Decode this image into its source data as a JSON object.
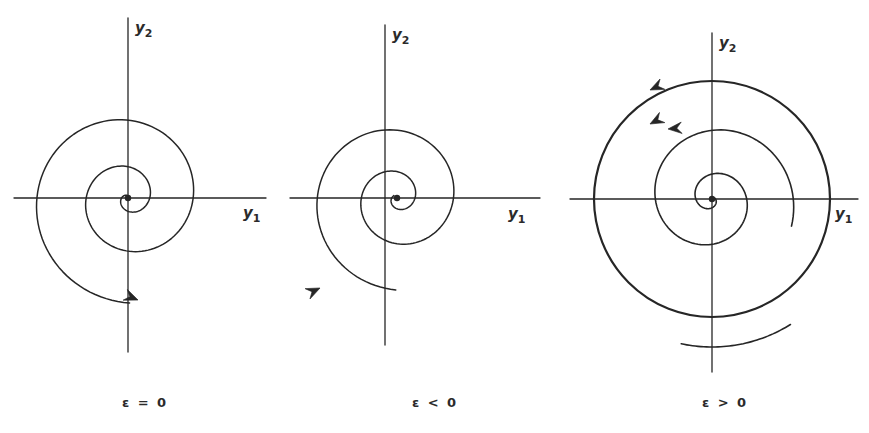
{
  "figure": {
    "title": "",
    "background": "#ffffff",
    "ink": "#262626",
    "width": 869,
    "height": 433
  },
  "panels": [
    {
      "id": "epsilon-zero",
      "caption": "ε = 0",
      "caption_x": 0,
      "caption_y": 395,
      "center": {
        "x": 128,
        "y": 198
      },
      "axes": {
        "x_axis": {
          "x1": 14,
          "y1": 198,
          "x2": 266,
          "y2": 198
        },
        "y_axis": {
          "x1": 128,
          "y1": 18,
          "x2": 128,
          "y2": 352
        },
        "x_label": {
          "text": "y",
          "sub": "1",
          "x": 243,
          "y": 205
        },
        "y_label": {
          "text": "y",
          "sub": "2",
          "x": 135,
          "y": 20
        }
      },
      "trajectory": {
        "type": "spiral",
        "direction": "outward",
        "rotation": "clockwise",
        "r_start": 3,
        "r_end": 105,
        "theta_start": 1.9,
        "theta_turns": 2.45,
        "stroke_width": 1.5
      },
      "arrows": [
        {
          "name": "flow-arrow",
          "x": 138,
          "y": 300,
          "angle": -22
        }
      ],
      "limit_cycle": null
    },
    {
      "id": "epsilon-negative",
      "caption": "ε < 0",
      "caption_x": 290,
      "caption_y": 395,
      "center": {
        "x": 397,
        "y": 198
      },
      "axes": {
        "x_axis": {
          "x1": 290,
          "y1": 198,
          "x2": 540,
          "y2": 198
        },
        "y_axis": {
          "x1": 385,
          "y1": 25,
          "x2": 385,
          "y2": 345
        },
        "x_label": {
          "text": "y",
          "sub": "1",
          "x": 508,
          "y": 206
        },
        "y_label": {
          "text": "y",
          "sub": "2",
          "x": 392,
          "y": 27
        }
      },
      "trajectory": {
        "type": "spiral",
        "direction": "outward",
        "rotation": "clockwise",
        "r_start": 4,
        "r_end": 92,
        "theta_start": 2.5,
        "theta_turns": 2.35,
        "stroke_width": 1.5
      },
      "arrows": [
        {
          "name": "flow-arrow",
          "x": 320,
          "y": 288,
          "angle": 25
        }
      ],
      "limit_cycle": null
    },
    {
      "id": "epsilon-positive",
      "caption": "ε > 0",
      "caption_x": 580,
      "caption_y": 395,
      "center": {
        "x": 712,
        "y": 199
      },
      "axes": {
        "x_axis": {
          "x1": 570,
          "y1": 199,
          "x2": 858,
          "y2": 199
        },
        "y_axis": {
          "x1": 712,
          "y1": 33,
          "x2": 712,
          "y2": 372
        },
        "x_label": {
          "text": "y",
          "sub": "1",
          "x": 835,
          "y": 206
        },
        "y_label": {
          "text": "y",
          "sub": "2",
          "x": 719,
          "y": 35
        }
      },
      "trajectory": {
        "type": "spiral",
        "direction": "outward",
        "rotation": "counterclockwise",
        "r_start": 3,
        "r_end": 84,
        "theta_start": 0.3,
        "theta_turns": 2.1,
        "stroke_width": 1.6
      },
      "arrows": [
        {
          "name": "limit-cycle-arrow",
          "x": 650,
          "y": 124,
          "angle": 208
        },
        {
          "name": "inner-spiral-arrow",
          "x": 668,
          "y": 129,
          "angle": 185
        }
      ],
      "limit_cycle": {
        "name": "limit-cycle",
        "radius": 118,
        "stroke_width": 2.2
      },
      "outer_arc": {
        "name": "incoming-arc",
        "radius": 148,
        "theta_start": 258,
        "theta_end": 302,
        "arrow": {
          "x": 650,
          "y": 90,
          "angle": 205
        }
      }
    }
  ],
  "chart_data": {
    "type": "line",
    "xlabel": "y₁",
    "ylabel": "y₂",
    "series": [
      {
        "name": "ε = 0",
        "description": "Outward spiral trajectory from the origin, clockwise, no limit cycle",
        "equilibrium": [
          0,
          0
        ],
        "turns": 2.45
      },
      {
        "name": "ε < 0",
        "description": "Spiral trajectory winding toward the origin, clockwise, stable focus",
        "equilibrium": [
          0,
          0
        ],
        "turns": 2.35
      },
      {
        "name": "ε > 0",
        "description": "Inner spiral growing outward onto a closed limit cycle, counterclockwise",
        "equilibrium": [
          0,
          0
        ],
        "turns": 2.1,
        "limit_cycle_radius": 118
      }
    ],
    "legend": "none",
    "grid": false
  }
}
